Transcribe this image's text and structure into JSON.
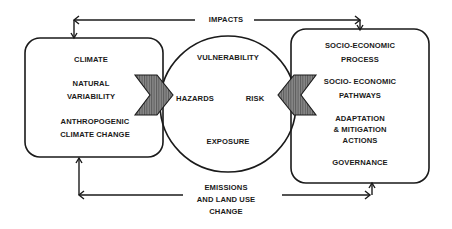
{
  "diagram": {
    "top_connector": {
      "label": "IMPACTS"
    },
    "bottom_connector": {
      "label_lines": [
        "EMISSIONS",
        "AND LAND USE",
        "CHANGE"
      ]
    },
    "left_box": {
      "items": [
        "CLIMATE",
        "NATURAL",
        "VARIABILITY",
        "ANTHROPOGENIC",
        "CLIMATE CHANGE"
      ]
    },
    "center_circle": {
      "top": "VULNERABILITY",
      "left": "HAZARDS",
      "right": "RISK",
      "bottom": "EXPOSURE"
    },
    "right_box": {
      "items": [
        "SOCIO-ECONOMIC",
        "PROCESS",
        "SOCIO- ECONOMIC",
        "PATHWAYS",
        "ADAPTATION",
        "& MITIGATION",
        "ACTIONS",
        "GOVERNANCE"
      ]
    },
    "colors": {
      "stroke": "#1a1a1a",
      "chevron_fill": "#7a7a7a",
      "background": "#ffffff"
    }
  }
}
